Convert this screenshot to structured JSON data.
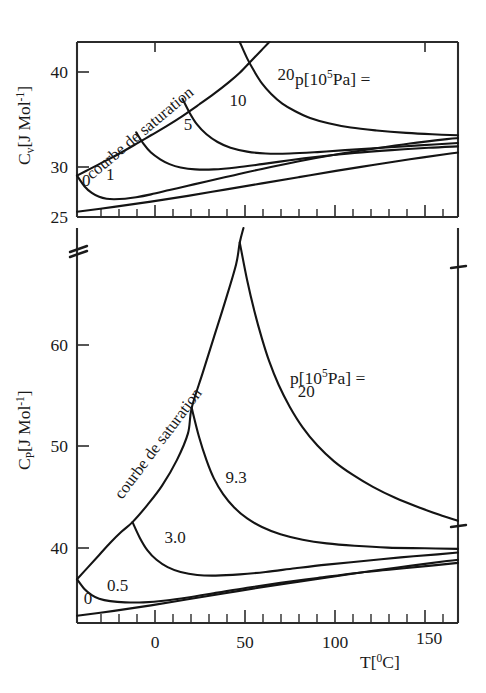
{
  "figure": {
    "background": "#ffffff",
    "line_color": "#141414",
    "panels": [
      "top",
      "bottom"
    ]
  },
  "chart_data": [
    {
      "type": "line",
      "panel": "top",
      "title": "",
      "xlabel": "",
      "ylabel": "C_v[J Mol^-1]",
      "ylabel_base": "C",
      "ylabel_sub": "v",
      "ylabel_rest": "[J Mol",
      "ylabel_sup": "-1",
      "ylabel_end": "]",
      "xlim": [
        -40,
        166
      ],
      "ylim": [
        25,
        43.2
      ],
      "yticks": [
        25,
        30,
        40
      ],
      "yticklabels": [
        "25",
        "30",
        "40"
      ],
      "xticks_major": [
        0,
        50,
        100,
        150
      ],
      "xticks_minor": [
        -30,
        -20,
        -10,
        10,
        20,
        30,
        40,
        60,
        70,
        80,
        90,
        110,
        120,
        130,
        140,
        160
      ],
      "xticklabels": [],
      "grid": false,
      "legend_title": "p[10^5 Pa] =",
      "legend_title_parts": {
        "pre": "p[10",
        "sup": "5",
        "post": "Pa] ="
      },
      "annotation": "courbe de saturation",
      "series": [
        {
          "name": "0",
          "label": "0",
          "label_xy": [
            -35,
            28.2
          ],
          "points": [
            [
              -40,
              29.3
            ],
            [
              -36,
              28.2
            ],
            [
              -32,
              27.5
            ],
            [
              -28,
              27.1
            ],
            [
              -24,
              26.9
            ],
            [
              -20,
              26.85
            ],
            [
              -14,
              26.9
            ],
            [
              -8,
              27.05
            ],
            [
              0,
              27.35
            ],
            [
              10,
              27.8
            ],
            [
              20,
              28.25
            ],
            [
              30,
              28.7
            ],
            [
              45,
              29.35
            ],
            [
              60,
              30.0
            ],
            [
              80,
              30.8
            ],
            [
              100,
              31.5
            ],
            [
              120,
              32.1
            ],
            [
              140,
              32.65
            ],
            [
              160,
              33.1
            ],
            [
              166,
              33.2
            ]
          ]
        },
        {
          "name": "1",
          "label": "1",
          "label_xy": [
            -22,
            28.9
          ],
          "points": [
            [
              -40,
              25.55
            ],
            [
              -20,
              26.05
            ],
            [
              0,
              26.6
            ],
            [
              20,
              27.2
            ],
            [
              40,
              27.85
            ],
            [
              60,
              28.5
            ],
            [
              80,
              29.15
            ],
            [
              100,
              29.8
            ],
            [
              120,
              30.4
            ],
            [
              140,
              31.0
            ],
            [
              160,
              31.55
            ],
            [
              166,
              31.7
            ]
          ]
        },
        {
          "name": "5",
          "label": "5",
          "label_xy": [
            20,
            34.1
          ],
          "points": [
            [
              -8,
              33.8
            ],
            [
              -4,
              32.6
            ],
            [
              0,
              31.7
            ],
            [
              5,
              31.0
            ],
            [
              10,
              30.5
            ],
            [
              16,
              30.15
            ],
            [
              24,
              29.95
            ],
            [
              34,
              29.95
            ],
            [
              46,
              30.15
            ],
            [
              60,
              30.5
            ],
            [
              75,
              30.9
            ],
            [
              90,
              31.25
            ],
            [
              110,
              31.65
            ],
            [
              130,
              31.95
            ],
            [
              150,
              32.2
            ],
            [
              166,
              32.35
            ]
          ]
        },
        {
          "name": "10",
          "label": "10",
          "label_xy": [
            47,
            36.5
          ],
          "points": [
            [
              17,
              37.3
            ],
            [
              21,
              35.8
            ],
            [
              25,
              34.6
            ],
            [
              30,
              33.6
            ],
            [
              36,
              32.8
            ],
            [
              43,
              32.2
            ],
            [
              52,
              31.8
            ],
            [
              62,
              31.6
            ],
            [
              75,
              31.6
            ],
            [
              90,
              31.75
            ],
            [
              105,
              31.95
            ],
            [
              125,
              32.2
            ],
            [
              145,
              32.45
            ],
            [
              166,
              32.7
            ]
          ]
        },
        {
          "name": "20",
          "label": "20",
          "label_xy": [
            73,
            39.3
          ],
          "points": [
            [
              48,
              43.2
            ],
            [
              52,
              41.5
            ],
            [
              56,
              40.1
            ],
            [
              60,
              38.9
            ],
            [
              65,
              37.8
            ],
            [
              71,
              36.8
            ],
            [
              78,
              36.0
            ],
            [
              86,
              35.3
            ],
            [
              96,
              34.75
            ],
            [
              108,
              34.3
            ],
            [
              122,
              34.0
            ],
            [
              138,
              33.75
            ],
            [
              152,
              33.6
            ],
            [
              166,
              33.5
            ]
          ]
        },
        {
          "name": "courbe de saturation",
          "label": "courbe de saturation",
          "points": [
            [
              -40,
              29.3
            ],
            [
              -34,
              29.9
            ],
            [
              -26,
              30.7
            ],
            [
              -18,
              31.5
            ],
            [
              -8,
              32.6
            ],
            [
              0,
              33.5
            ],
            [
              8,
              34.4
            ],
            [
              17,
              35.5
            ],
            [
              26,
              36.7
            ],
            [
              34,
              37.8
            ],
            [
              42,
              39.0
            ],
            [
              48,
              40.0
            ],
            [
              54,
              41.2
            ],
            [
              60,
              42.4
            ],
            [
              64,
              43.2
            ]
          ]
        }
      ]
    },
    {
      "type": "line",
      "panel": "bottom",
      "title": "",
      "xlabel": "T[^0C]",
      "xlabel_parts": {
        "pre": "T[",
        "sup": "0",
        "post": "C]"
      },
      "ylabel": "C_P[J Mol^-1]",
      "ylabel_base": "C",
      "ylabel_sub": "P",
      "ylabel_rest": "[J Mol",
      "ylabel_sup": "-1",
      "ylabel_end": "]",
      "xlim": [
        -40,
        166
      ],
      "ylim": [
        35.0,
        67.5
      ],
      "yticks": [
        40,
        50,
        60
      ],
      "yticklabels": [
        "40",
        "50",
        "60"
      ],
      "xticks_major": [
        0,
        50,
        100,
        150
      ],
      "xticklabels": [
        "0",
        "50",
        "100",
        "150"
      ],
      "xticks_minor": [
        -30,
        -20,
        -10,
        10,
        20,
        30,
        40,
        60,
        70,
        80,
        90,
        110,
        120,
        130,
        140,
        160
      ],
      "grid": false,
      "legend_title": "p[10^5 Pa] =",
      "legend_title_parts": {
        "pre": "p[10",
        "sup": "5",
        "post": "Pa] ="
      },
      "annotation": "courbe de saturation",
      "series": [
        {
          "name": "0",
          "label": "0",
          "label_xy": [
            -34,
            36.6
          ],
          "points": [
            [
              -40,
              35.6
            ],
            [
              -20,
              36.0
            ],
            [
              0,
              36.45
            ],
            [
              20,
              36.95
            ],
            [
              40,
              37.45
            ],
            [
              60,
              37.95
            ],
            [
              80,
              38.4
            ],
            [
              100,
              38.85
            ],
            [
              120,
              39.3
            ],
            [
              140,
              39.7
            ],
            [
              160,
              40.1
            ],
            [
              166,
              40.2
            ]
          ]
        },
        {
          "name": "0.5",
          "label": "0.5",
          "label_xy": [
            -18,
            37.6
          ],
          "points": [
            [
              -40,
              38.6
            ],
            [
              -36,
              37.8
            ],
            [
              -32,
              37.3
            ],
            [
              -28,
              37.0
            ],
            [
              -22,
              36.8
            ],
            [
              -14,
              36.7
            ],
            [
              -4,
              36.7
            ],
            [
              8,
              36.85
            ],
            [
              20,
              37.1
            ],
            [
              36,
              37.5
            ],
            [
              52,
              37.9
            ],
            [
              70,
              38.3
            ],
            [
              90,
              38.7
            ],
            [
              110,
              39.1
            ],
            [
              130,
              39.4
            ],
            [
              150,
              39.7
            ],
            [
              166,
              39.95
            ]
          ]
        },
        {
          "name": "3.0",
          "label": "3.0",
          "label_xy": [
            13,
            41.6
          ],
          "points": [
            [
              -10,
              43.3
            ],
            [
              -6,
              42.0
            ],
            [
              -2,
              41.0
            ],
            [
              3,
              40.2
            ],
            [
              9,
              39.6
            ],
            [
              16,
              39.2
            ],
            [
              25,
              38.95
            ],
            [
              35,
              38.9
            ],
            [
              48,
              39.0
            ],
            [
              62,
              39.2
            ],
            [
              78,
              39.5
            ],
            [
              95,
              39.8
            ],
            [
              115,
              40.1
            ],
            [
              135,
              40.4
            ],
            [
              155,
              40.65
            ],
            [
              166,
              40.8
            ]
          ]
        },
        {
          "name": "9.3",
          "label": "9.3",
          "label_xy": [
            46,
            46.5
          ],
          "points": [
            [
              22,
              52.7
            ],
            [
              26,
              50.3
            ],
            [
              30,
              48.4
            ],
            [
              34,
              46.9
            ],
            [
              39,
              45.6
            ],
            [
              45,
              44.5
            ],
            [
              52,
              43.6
            ],
            [
              60,
              42.9
            ],
            [
              70,
              42.3
            ],
            [
              82,
              41.85
            ],
            [
              95,
              41.55
            ],
            [
              110,
              41.35
            ],
            [
              128,
              41.2
            ],
            [
              148,
              41.15
            ],
            [
              166,
              41.1
            ]
          ]
        },
        {
          "name": "20",
          "label": "20",
          "label_xy": [
            84,
            53.6
          ],
          "points": [
            [
              48,
              66.3
            ],
            [
              52,
              63.2
            ],
            [
              56,
              60.6
            ],
            [
              60,
              58.4
            ],
            [
              64,
              56.5
            ],
            [
              69,
              54.6
            ],
            [
              75,
              52.8
            ],
            [
              82,
              51.1
            ],
            [
              90,
              49.6
            ],
            [
              99,
              48.3
            ],
            [
              109,
              47.2
            ],
            [
              120,
              46.2
            ],
            [
              132,
              45.3
            ],
            [
              145,
              44.5
            ],
            [
              156,
              43.9
            ],
            [
              166,
              43.4
            ]
          ]
        },
        {
          "name": "courbe de saturation",
          "label": "courbe de saturation",
          "points": [
            [
              -40,
              38.6
            ],
            [
              -34,
              39.6
            ],
            [
              -28,
              40.6
            ],
            [
              -22,
              41.6
            ],
            [
              -16,
              42.5
            ],
            [
              -10,
              43.3
            ],
            [
              -2,
              44.7
            ],
            [
              6,
              46.3
            ],
            [
              14,
              48.4
            ],
            [
              20,
              50.6
            ],
            [
              22,
              52.7
            ],
            [
              28,
              55.6
            ],
            [
              34,
              58.5
            ],
            [
              40,
              61.4
            ],
            [
              46,
              64.5
            ],
            [
              48,
              66.3
            ],
            [
              50,
              67.5
            ]
          ]
        }
      ]
    }
  ],
  "annotations": {
    "saturation_curve_label": "courbe de saturation",
    "axis_break": "axis-break-mark"
  }
}
